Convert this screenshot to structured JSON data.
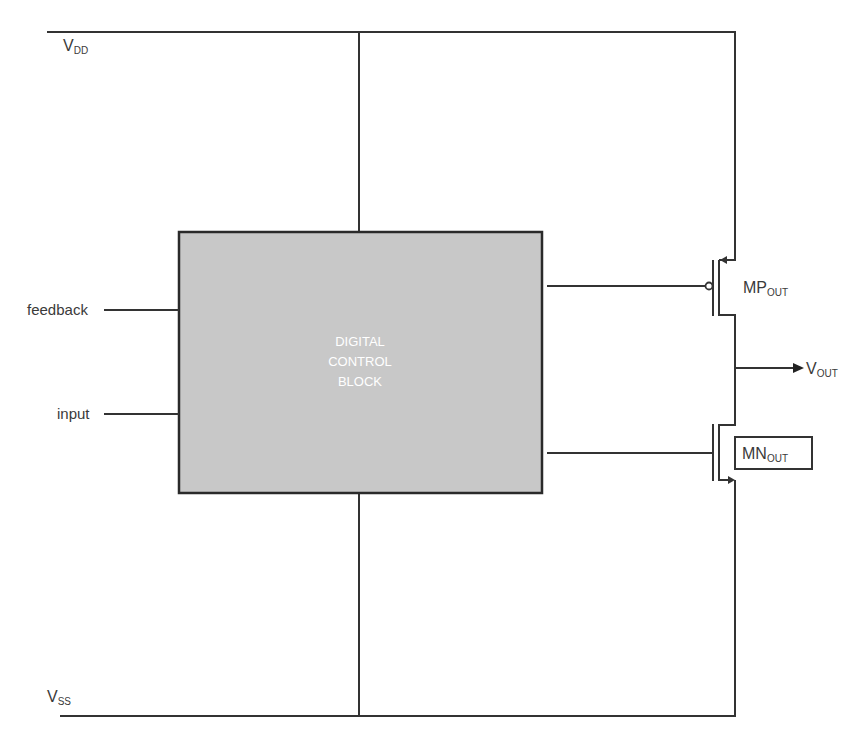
{
  "diagram": {
    "type": "circuit-schematic",
    "rails": {
      "top": {
        "label_main": "V",
        "label_sub": "DD"
      },
      "bottom": {
        "label_main": "V",
        "label_sub": "SS"
      }
    },
    "block": {
      "line1": "DIGITAL",
      "line2": "CONTROL",
      "line3": "BLOCK",
      "fill": "#c8c8c8"
    },
    "inputs": [
      {
        "label": "feedback"
      },
      {
        "label": "input"
      }
    ],
    "transistors": [
      {
        "name_main": "MP",
        "name_sub": "OUT",
        "kind": "pmos"
      },
      {
        "name_main": "MN",
        "name_sub": "OUT",
        "kind": "nmos"
      }
    ],
    "output": {
      "label_main": "V",
      "label_sub": "OUT"
    },
    "colors": {
      "wire": "#333333",
      "block_border": "#2a2a2a",
      "block_fill": "#c8c8c8",
      "text": "#3a3a3a"
    }
  }
}
